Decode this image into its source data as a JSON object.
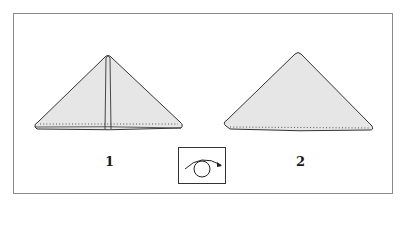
{
  "diagram": {
    "steps": [
      {
        "number": "1",
        "description": "triangle folded with center vertical crease"
      },
      {
        "number": "2",
        "description": "triangle after turning over"
      }
    ],
    "flip_icon": "turn-over-icon",
    "colors": {
      "fill": "#e6e6e6",
      "stroke": "#333333",
      "frame": "#8a8a8a"
    }
  }
}
